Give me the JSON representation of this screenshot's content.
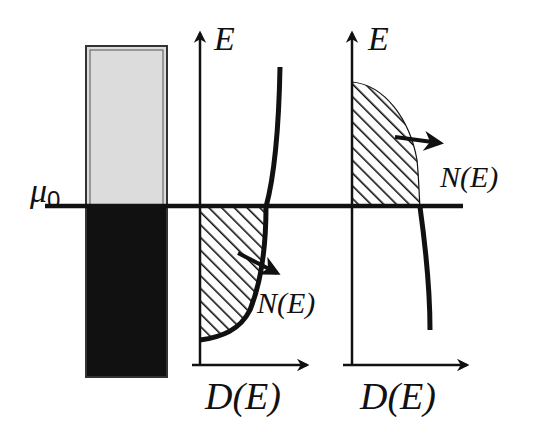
{
  "figure": {
    "type": "energy-band / density-of-states schematic",
    "chemical_potential_label": {
      "symbol": "μ",
      "subscript": "0"
    },
    "band_bar": {
      "upper_fill": "#dddddd",
      "lower_fill": "#111111",
      "description": "Band split at chemical potential: upper (empty) light gray, lower (filled) black"
    },
    "panel_left": {
      "y_axis_label": "E",
      "x_axis_label": "D(E)",
      "curve_label": "N(E)",
      "description": "Density of states increasing with energy; occupied states below μ0 hatched"
    },
    "panel_right": {
      "y_axis_label": "E",
      "x_axis_label": "D(E)",
      "curve_label": "N(E)",
      "description": "Density of states decreasing with energy; occupied states above μ0 hatched"
    },
    "colors": {
      "ink": "#111111",
      "background": "#ffffff",
      "empty_band": "#dddddd"
    }
  }
}
